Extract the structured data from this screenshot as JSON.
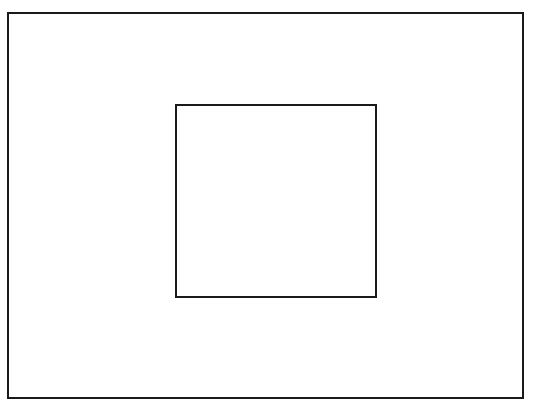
{
  "diagram": {
    "background": "#ffffff",
    "shapes": [
      {
        "name": "outer-rectangle",
        "x": 7,
        "y": 12,
        "width": 517,
        "height": 387,
        "stroke": "#1a1a1a",
        "stroke_width": 2
      },
      {
        "name": "inner-rectangle",
        "x": 175,
        "y": 104,
        "width": 202,
        "height": 194,
        "stroke": "#1a1a1a",
        "stroke_width": 2
      }
    ]
  }
}
